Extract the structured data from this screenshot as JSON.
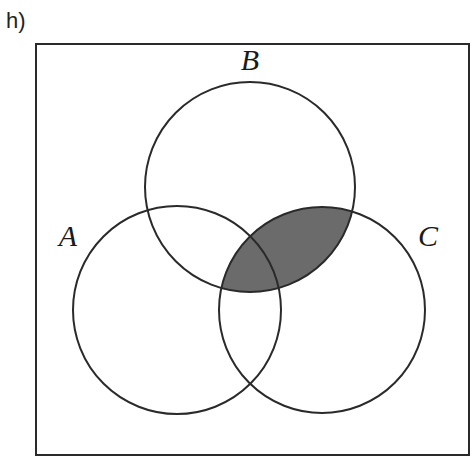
{
  "part_label": "h)",
  "universal_set": {
    "x": 36,
    "y": 44,
    "width": 433,
    "height": 411
  },
  "sets": [
    {
      "name": "A",
      "label": "A",
      "cx": 177,
      "cy": 310,
      "r": 104,
      "label_x": 68,
      "label_y": 246
    },
    {
      "name": "B",
      "label": "B",
      "cx": 250,
      "cy": 187,
      "r": 105,
      "label_x": 250,
      "label_y": 70
    },
    {
      "name": "C",
      "label": "C",
      "cx": 322,
      "cy": 310,
      "r": 103,
      "label_x": 428,
      "label_y": 246
    }
  ],
  "shaded_region": "B ∩ C",
  "colors": {
    "outline": "#2a2a2a",
    "shade": "#6b6b6b",
    "background": "#ffffff"
  }
}
